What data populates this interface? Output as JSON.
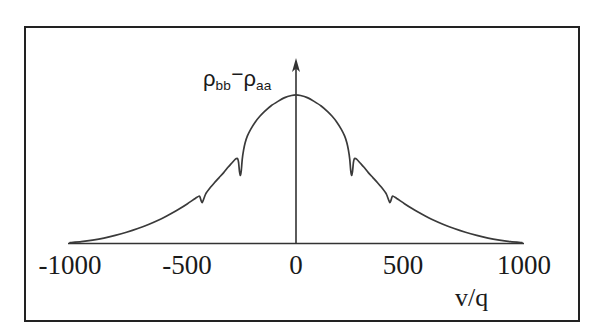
{
  "figure": {
    "background_color": "#ffffff",
    "border_color": "#222222",
    "curve_color": "#3a3a3a",
    "axis_color": "#333333"
  },
  "axes": {
    "y_axis_label_rho_bb": "ρ",
    "y_axis_label_sub_bb": "bb",
    "y_axis_label_minus": "−",
    "y_axis_label_rho_aa": "ρ",
    "y_axis_label_sub_aa": "aa",
    "x_axis_title": "v/q"
  },
  "chart_data": {
    "type": "line",
    "title": "",
    "xlabel": "v/q",
    "ylabel": "ρbb − ρaa",
    "xlim": [
      -1000,
      1000
    ],
    "ylim": [
      0,
      1
    ],
    "grid": false,
    "legend": null,
    "xticks": [
      -1000,
      -500,
      0,
      500,
      1000
    ],
    "xticklabels": [
      "-1000",
      "-500",
      "0",
      "500",
      "1000"
    ],
    "yticks": [],
    "yticklabels": [],
    "annotations": [
      "Symmetric broad population-inversion profile with sharp dips near v/q = ±250 and ±420"
    ],
    "series": [
      {
        "name": "rho_bb - rho_aa",
        "x": [
          -1000,
          -950,
          -900,
          -850,
          -800,
          -750,
          -700,
          -650,
          -600,
          -570,
          -540,
          -510,
          -480,
          -460,
          -440,
          -430,
          -425,
          -420,
          -415,
          -410,
          -400,
          -380,
          -360,
          -340,
          -320,
          -300,
          -285,
          -275,
          -268,
          -262,
          -258,
          -254,
          -250,
          -246,
          -242,
          -238,
          -232,
          -225,
          -215,
          -200,
          -180,
          -160,
          -140,
          -110,
          -80,
          -50,
          -20,
          0,
          20,
          50,
          80,
          110,
          140,
          160,
          180,
          200,
          215,
          225,
          232,
          238,
          242,
          246,
          250,
          254,
          258,
          262,
          268,
          275,
          285,
          300,
          320,
          340,
          360,
          380,
          400,
          410,
          415,
          420,
          425,
          430,
          440,
          460,
          480,
          510,
          540,
          570,
          600,
          650,
          700,
          750,
          800,
          850,
          900,
          950,
          1000
        ],
        "y": [
          0.005,
          0.012,
          0.022,
          0.035,
          0.052,
          0.072,
          0.096,
          0.124,
          0.156,
          0.178,
          0.202,
          0.228,
          0.256,
          0.276,
          0.296,
          0.304,
          0.3,
          0.276,
          0.262,
          0.28,
          0.318,
          0.358,
          0.392,
          0.424,
          0.456,
          0.492,
          0.516,
          0.532,
          0.542,
          0.548,
          0.545,
          0.52,
          0.462,
          0.438,
          0.47,
          0.54,
          0.6,
          0.648,
          0.692,
          0.736,
          0.782,
          0.818,
          0.848,
          0.886,
          0.914,
          0.938,
          0.952,
          0.956,
          0.952,
          0.938,
          0.914,
          0.886,
          0.848,
          0.818,
          0.782,
          0.736,
          0.692,
          0.648,
          0.6,
          0.54,
          0.47,
          0.438,
          0.462,
          0.52,
          0.545,
          0.548,
          0.542,
          0.532,
          0.516,
          0.492,
          0.456,
          0.424,
          0.392,
          0.358,
          0.318,
          0.28,
          0.262,
          0.276,
          0.3,
          0.304,
          0.296,
          0.276,
          0.256,
          0.228,
          0.202,
          0.178,
          0.156,
          0.124,
          0.096,
          0.072,
          0.052,
          0.035,
          0.022,
          0.012,
          0.005
        ]
      }
    ]
  }
}
